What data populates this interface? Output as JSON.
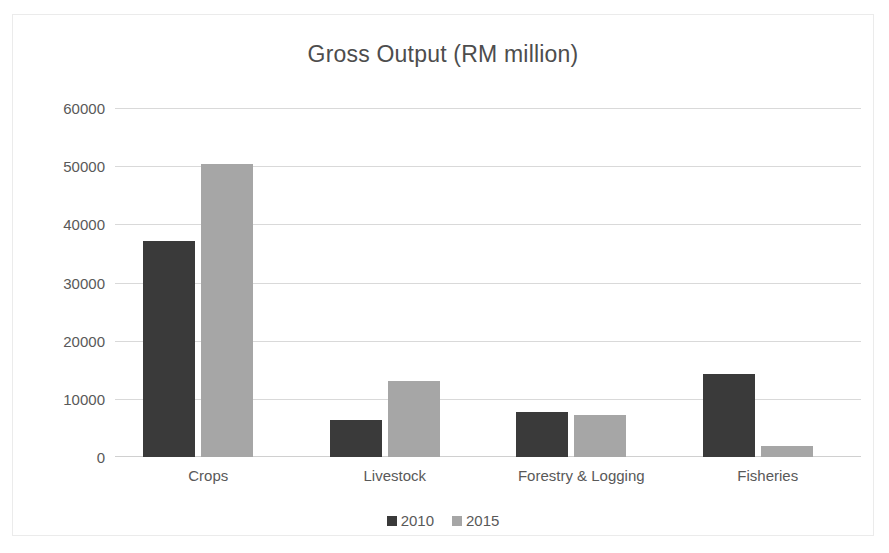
{
  "chart_data": {
    "type": "bar",
    "title": "Gross Output (RM million)",
    "xlabel": "",
    "ylabel": "",
    "categories": [
      "Crops",
      "Livestock",
      "Forestry & Logging",
      "Fisheries"
    ],
    "series": [
      {
        "name": "2010",
        "color": "#3a3a3a",
        "values": [
          37200,
          6300,
          7700,
          14300
        ]
      },
      {
        "name": "2015",
        "color": "#a6a6a6",
        "values": [
          50600,
          13100,
          7200,
          1900
        ]
      }
    ],
    "ylim": [
      0,
      60000
    ],
    "yticks": [
      "60000",
      "50000",
      "40000",
      "30000",
      "20000",
      "10000",
      "0"
    ],
    "ytick_values": [
      60000,
      50000,
      40000,
      30000,
      20000,
      10000,
      0
    ],
    "grid": true,
    "legend_position": "bottom",
    "legend_entries": [
      "2010",
      "2015"
    ]
  }
}
